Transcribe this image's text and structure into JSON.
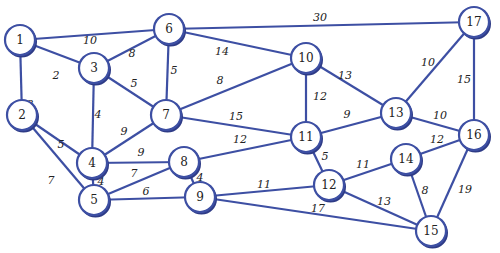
{
  "diagram": {
    "type": "weighted-undirected-graph",
    "colors": {
      "edge": "#3d4fa3",
      "node_fill": "#ffffff",
      "node_stroke": "#3d4fa3",
      "text": "#222222"
    },
    "nodes": [
      {
        "id": "1",
        "x": 20,
        "y": 40
      },
      {
        "id": "2",
        "x": 22,
        "y": 115
      },
      {
        "id": "3",
        "x": 94,
        "y": 68
      },
      {
        "id": "4",
        "x": 92,
        "y": 163
      },
      {
        "id": "5",
        "x": 94,
        "y": 200
      },
      {
        "id": "6",
        "x": 169,
        "y": 29
      },
      {
        "id": "7",
        "x": 166,
        "y": 115
      },
      {
        "id": "8",
        "x": 184,
        "y": 162
      },
      {
        "id": "9",
        "x": 200,
        "y": 197
      },
      {
        "id": "10",
        "x": 306,
        "y": 58
      },
      {
        "id": "11",
        "x": 306,
        "y": 137
      },
      {
        "id": "12",
        "x": 329,
        "y": 185
      },
      {
        "id": "13",
        "x": 396,
        "y": 113
      },
      {
        "id": "14",
        "x": 406,
        "y": 159
      },
      {
        "id": "15",
        "x": 431,
        "y": 231
      },
      {
        "id": "16",
        "x": 474,
        "y": 135
      },
      {
        "id": "17",
        "x": 474,
        "y": 22
      }
    ],
    "edges": [
      {
        "from": "1",
        "to": "6",
        "weight": "10",
        "lx": 90,
        "ly": 40
      },
      {
        "from": "1",
        "to": "3",
        "weight": "2",
        "lx": 56,
        "ly": 75
      },
      {
        "from": "1",
        "to": "2",
        "weight": "3",
        "lx": 30,
        "ly": 104
      },
      {
        "from": "3",
        "to": "6",
        "weight": "8",
        "lx": 132,
        "ly": 53
      },
      {
        "from": "3",
        "to": "7",
        "weight": "5",
        "lx": 134,
        "ly": 83
      },
      {
        "from": "3",
        "to": "4",
        "weight": "4",
        "lx": 98,
        "ly": 114
      },
      {
        "from": "6",
        "to": "7",
        "weight": "5",
        "lx": 174,
        "ly": 70
      },
      {
        "from": "6",
        "to": "10",
        "weight": "14",
        "lx": 222,
        "ly": 51
      },
      {
        "from": "6",
        "to": "17",
        "weight": "30",
        "lx": 320,
        "ly": 17
      },
      {
        "from": "7",
        "to": "10",
        "weight": "8",
        "lx": 220,
        "ly": 80
      },
      {
        "from": "7",
        "to": "4",
        "weight": "9",
        "lx": 124,
        "ly": 131
      },
      {
        "from": "7",
        "to": "11",
        "weight": "15",
        "lx": 236,
        "ly": 116
      },
      {
        "from": "2",
        "to": "4",
        "weight": "5",
        "lx": 61,
        "ly": 144
      },
      {
        "from": "2",
        "to": "5",
        "weight": "7",
        "lx": 51,
        "ly": 180
      },
      {
        "from": "4",
        "to": "8",
        "weight": "9",
        "lx": 141,
        "ly": 152
      },
      {
        "from": "4",
        "to": "5",
        "weight": "4",
        "lx": 101,
        "ly": 181
      },
      {
        "from": "5",
        "to": "8",
        "weight": "7",
        "lx": 134,
        "ly": 173
      },
      {
        "from": "5",
        "to": "9",
        "weight": "6",
        "lx": 146,
        "ly": 191
      },
      {
        "from": "8",
        "to": "11",
        "weight": "12",
        "lx": 240,
        "ly": 139
      },
      {
        "from": "8",
        "to": "9",
        "weight": "4",
        "lx": 200,
        "ly": 177
      },
      {
        "from": "9",
        "to": "12",
        "weight": "11",
        "lx": 264,
        "ly": 184
      },
      {
        "from": "9",
        "to": "15",
        "weight": "17",
        "lx": 318,
        "ly": 208
      },
      {
        "from": "10",
        "to": "11",
        "weight": "12",
        "lx": 320,
        "ly": 96
      },
      {
        "from": "10",
        "to": "13",
        "weight": "13",
        "lx": 345,
        "ly": 75
      },
      {
        "from": "11",
        "to": "13",
        "weight": "9",
        "lx": 347,
        "ly": 114
      },
      {
        "from": "11",
        "to": "12",
        "weight": "5",
        "lx": 325,
        "ly": 156
      },
      {
        "from": "12",
        "to": "14",
        "weight": "11",
        "lx": 363,
        "ly": 164
      },
      {
        "from": "12",
        "to": "15",
        "weight": "13",
        "lx": 384,
        "ly": 201
      },
      {
        "from": "13",
        "to": "17",
        "weight": "10",
        "lx": 428,
        "ly": 62
      },
      {
        "from": "13",
        "to": "16",
        "weight": "10",
        "lx": 440,
        "ly": 115
      },
      {
        "from": "14",
        "to": "16",
        "weight": "12",
        "lx": 437,
        "ly": 139
      },
      {
        "from": "14",
        "to": "15",
        "weight": "8",
        "lx": 425,
        "ly": 190
      },
      {
        "from": "16",
        "to": "17",
        "weight": "15",
        "lx": 464,
        "ly": 79
      },
      {
        "from": "16",
        "to": "15",
        "weight": "19",
        "lx": 465,
        "ly": 189
      }
    ]
  }
}
